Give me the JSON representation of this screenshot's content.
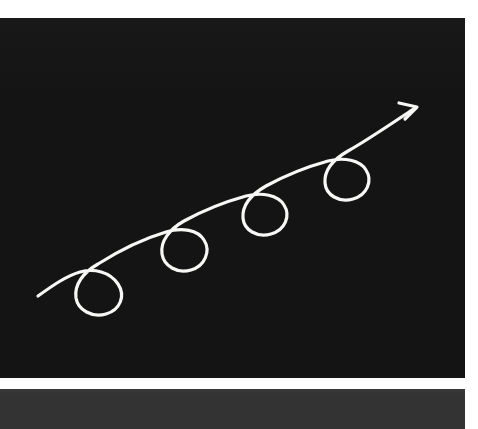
{
  "canvas": {
    "name": "drawing-canvas",
    "background_color": "#141414",
    "width": 465,
    "height": 360,
    "offset_top": 18,
    "stroke_color": "#f7f7f5",
    "stroke_width": 3.2,
    "annotation_alt": "Hand-drawn upward trending arrow with four loops",
    "path_d": "M 38 278 C 52 268, 66 258, 80 254 C 94 250, 110 254, 118 266 C 126 278, 120 292, 106 296 C 92 300, 78 292, 76 280 C 74 266, 84 254, 98 246 C 120 232, 146 220, 166 214 C 182 209, 198 212, 204 222 C 211 233, 205 248, 191 252 C 177 256, 164 248, 162 236 C 160 223, 170 211, 184 203 C 204 192, 228 183, 246 178 C 262 174, 278 177, 284 187 C 291 198, 285 212, 271 216 C 257 220, 244 212, 243 200 C 242 187, 252 176, 266 168 C 286 157, 310 148, 328 143 C 344 139, 360 142, 366 152 C 373 163, 367 177, 353 181 C 339 185, 326 177, 325 165 C 324 152, 334 141, 348 133 C 366 123, 388 108, 415 90",
    "arrowhead_d": "M 399 85 L 417 89 L 405 101",
    "loops": [
      {
        "name": "loop-1",
        "cx": 97,
        "cy": 275,
        "rx": 22,
        "ry": 24
      },
      {
        "name": "loop-2",
        "cx": 183,
        "cy": 232,
        "rx": 22,
        "ry": 24
      },
      {
        "name": "loop-3",
        "cx": 263,
        "cy": 195,
        "rx": 21,
        "ry": 23
      },
      {
        "name": "loop-4",
        "cx": 345,
        "cy": 160,
        "rx": 21,
        "ry": 23
      }
    ],
    "start_point": {
      "x": 38,
      "y": 278
    },
    "end_point": {
      "x": 417,
      "y": 89
    }
  },
  "bottom_bar": {
    "name": "bottom-toolbar",
    "background_color": "#333333",
    "height": 40,
    "offset_top": 389,
    "width": 465
  },
  "page": {
    "background_color": "#ffffff",
    "width": 478,
    "height": 429
  }
}
